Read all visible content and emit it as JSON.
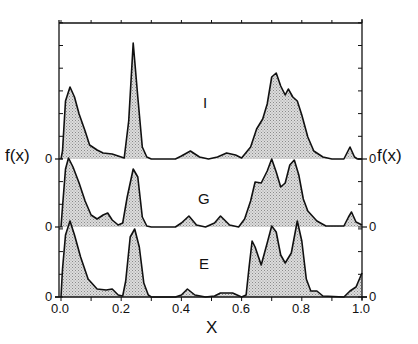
{
  "chart_data": {
    "type": "area",
    "title": "",
    "xlabel": "X",
    "ylabel": "f(x)",
    "xlim": [
      0.0,
      1.0
    ],
    "x_ticks": [
      "0.0",
      "0.2",
      "0.4",
      "0.6",
      "0.8",
      "1.0"
    ],
    "y_zero_label": "0",
    "layout": "three vertically offset filled curves (stacked panels) sharing x axis; grid off; labels I, G, E placed inside panels",
    "series": [
      {
        "name": "I",
        "baseline_px": 159,
        "label_pos": {
          "x": 0.47,
          "px_y": 102
        },
        "points": [
          [
            0.0,
            0
          ],
          [
            0.005,
            8
          ],
          [
            0.015,
            58
          ],
          [
            0.03,
            72
          ],
          [
            0.045,
            62
          ],
          [
            0.06,
            45
          ],
          [
            0.08,
            28
          ],
          [
            0.095,
            14
          ],
          [
            0.12,
            9
          ],
          [
            0.14,
            6
          ],
          [
            0.17,
            5
          ],
          [
            0.19,
            3
          ],
          [
            0.21,
            1
          ],
          [
            0.225,
            38
          ],
          [
            0.24,
            116
          ],
          [
            0.255,
            62
          ],
          [
            0.27,
            12
          ],
          [
            0.285,
            2
          ],
          [
            0.3,
            0
          ],
          [
            0.38,
            0
          ],
          [
            0.4,
            3
          ],
          [
            0.43,
            8
          ],
          [
            0.46,
            2
          ],
          [
            0.49,
            0
          ],
          [
            0.52,
            2
          ],
          [
            0.55,
            6
          ],
          [
            0.58,
            4
          ],
          [
            0.6,
            1
          ],
          [
            0.63,
            12
          ],
          [
            0.65,
            30
          ],
          [
            0.67,
            40
          ],
          [
            0.685,
            55
          ],
          [
            0.7,
            82
          ],
          [
            0.715,
            86
          ],
          [
            0.73,
            73
          ],
          [
            0.745,
            64
          ],
          [
            0.755,
            70
          ],
          [
            0.77,
            62
          ],
          [
            0.785,
            58
          ],
          [
            0.8,
            44
          ],
          [
            0.82,
            22
          ],
          [
            0.84,
            8
          ],
          [
            0.87,
            2
          ],
          [
            0.9,
            0
          ],
          [
            0.94,
            0
          ],
          [
            0.96,
            12
          ],
          [
            0.975,
            2
          ],
          [
            0.985,
            0
          ],
          [
            1.0,
            0
          ]
        ]
      },
      {
        "name": "G",
        "baseline_px": 227,
        "label_pos": {
          "x": 0.47,
          "px_y": 197
        },
        "points": [
          [
            0.0,
            0
          ],
          [
            0.005,
            20
          ],
          [
            0.015,
            58
          ],
          [
            0.025,
            69
          ],
          [
            0.04,
            60
          ],
          [
            0.06,
            44
          ],
          [
            0.08,
            26
          ],
          [
            0.1,
            12
          ],
          [
            0.12,
            8
          ],
          [
            0.14,
            12
          ],
          [
            0.155,
            14
          ],
          [
            0.17,
            7
          ],
          [
            0.19,
            2
          ],
          [
            0.205,
            4
          ],
          [
            0.22,
            30
          ],
          [
            0.24,
            58
          ],
          [
            0.255,
            50
          ],
          [
            0.27,
            10
          ],
          [
            0.285,
            1
          ],
          [
            0.3,
            0
          ],
          [
            0.38,
            0
          ],
          [
            0.4,
            4
          ],
          [
            0.425,
            11
          ],
          [
            0.45,
            2
          ],
          [
            0.48,
            0
          ],
          [
            0.51,
            4
          ],
          [
            0.53,
            11
          ],
          [
            0.56,
            2
          ],
          [
            0.59,
            0
          ],
          [
            0.61,
            8
          ],
          [
            0.63,
            26
          ],
          [
            0.645,
            45
          ],
          [
            0.665,
            44
          ],
          [
            0.685,
            56
          ],
          [
            0.7,
            68
          ],
          [
            0.715,
            55
          ],
          [
            0.73,
            40
          ],
          [
            0.745,
            44
          ],
          [
            0.76,
            62
          ],
          [
            0.775,
            67
          ],
          [
            0.79,
            52
          ],
          [
            0.805,
            28
          ],
          [
            0.82,
            16
          ],
          [
            0.85,
            6
          ],
          [
            0.88,
            1
          ],
          [
            0.94,
            1
          ],
          [
            0.955,
            10
          ],
          [
            0.965,
            15
          ],
          [
            0.98,
            5
          ],
          [
            1.0,
            2
          ]
        ]
      },
      {
        "name": "E",
        "baseline_px": 297,
        "label_pos": {
          "x": 0.47,
          "px_y": 262
        },
        "points": [
          [
            0.0,
            0
          ],
          [
            0.005,
            28
          ],
          [
            0.015,
            62
          ],
          [
            0.03,
            76
          ],
          [
            0.045,
            62
          ],
          [
            0.065,
            40
          ],
          [
            0.09,
            18
          ],
          [
            0.12,
            8
          ],
          [
            0.15,
            7
          ],
          [
            0.17,
            8
          ],
          [
            0.19,
            2
          ],
          [
            0.205,
            1
          ],
          [
            0.215,
            16
          ],
          [
            0.23,
            60
          ],
          [
            0.245,
            68
          ],
          [
            0.26,
            50
          ],
          [
            0.275,
            14
          ],
          [
            0.29,
            2
          ],
          [
            0.3,
            0
          ],
          [
            0.38,
            0
          ],
          [
            0.4,
            2
          ],
          [
            0.42,
            8
          ],
          [
            0.445,
            2
          ],
          [
            0.48,
            0
          ],
          [
            0.51,
            1
          ],
          [
            0.53,
            4
          ],
          [
            0.57,
            4
          ],
          [
            0.6,
            0
          ],
          [
            0.615,
            2
          ],
          [
            0.625,
            30
          ],
          [
            0.635,
            56
          ],
          [
            0.645,
            50
          ],
          [
            0.665,
            32
          ],
          [
            0.685,
            54
          ],
          [
            0.7,
            71
          ],
          [
            0.715,
            65
          ],
          [
            0.73,
            42
          ],
          [
            0.745,
            34
          ],
          [
            0.765,
            44
          ],
          [
            0.785,
            76
          ],
          [
            0.8,
            56
          ],
          [
            0.815,
            18
          ],
          [
            0.83,
            6
          ],
          [
            0.85,
            6
          ],
          [
            0.87,
            1
          ],
          [
            0.94,
            0
          ],
          [
            0.96,
            6
          ],
          [
            0.98,
            10
          ],
          [
            1.0,
            24
          ]
        ]
      }
    ],
    "style": {
      "fill_color": "#c8c8c8",
      "line_color": "#111111",
      "axis_color": "#111111"
    }
  },
  "labels": {
    "ylabel_left": "f(x)",
    "ylabel_right": "f(x)",
    "xlabel": "X",
    "zero": "0",
    "series_I": "I",
    "series_G": "G",
    "series_E": "E",
    "x_ticks": [
      "0.0",
      "0.2",
      "0.4",
      "0.6",
      "0.8",
      "1.0"
    ]
  }
}
